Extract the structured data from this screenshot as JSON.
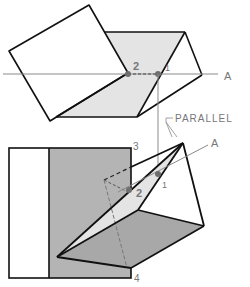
{
  "figure": {
    "type": "descriptive geometry - true angle between planes",
    "labels": {
      "top_axis": "A",
      "top_point_1": "1",
      "top_point_2": "2",
      "parallel": "PARALLEL",
      "bottom_axis": "A",
      "bottom_point_1": "1",
      "bottom_point_2": "2",
      "point_3": "3",
      "point_4": "4"
    },
    "colors": {
      "line": "#111111",
      "construction": "#8a8a8a",
      "light_fill": "#e4e4e4",
      "dark_fill": "#b4b4b4",
      "point": "#6e6e6e",
      "label": "#777777"
    }
  }
}
